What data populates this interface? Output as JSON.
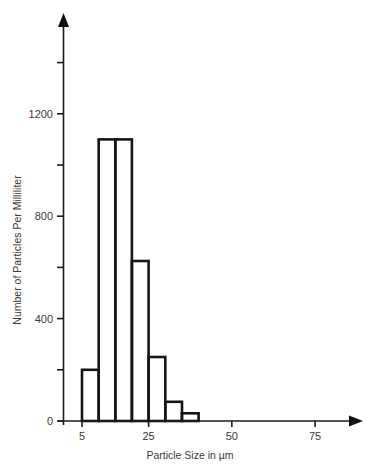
{
  "chart_data": {
    "type": "bar",
    "subtype": "histogram",
    "title": "",
    "xlabel": "Particle Size in µm",
    "ylabel": "Number of Particles Per Milliliter",
    "bin_width": 5,
    "bins": [
      {
        "start": 5,
        "end": 10,
        "value": 200
      },
      {
        "start": 10,
        "end": 15,
        "value": 1100
      },
      {
        "start": 15,
        "end": 20,
        "value": 1100
      },
      {
        "start": 20,
        "end": 25,
        "value": 625
      },
      {
        "start": 25,
        "end": 30,
        "value": 250
      },
      {
        "start": 30,
        "end": 35,
        "value": 75
      },
      {
        "start": 35,
        "end": 40,
        "value": 30
      }
    ],
    "categories": [
      "5-10",
      "10-15",
      "15-20",
      "20-25",
      "25-30",
      "30-35",
      "35-40"
    ],
    "values": [
      200,
      1100,
      1100,
      625,
      250,
      75,
      30
    ],
    "x_ticks": [
      {
        "value": 5,
        "label": "5"
      },
      {
        "value": 25,
        "label": "25"
      },
      {
        "value": 50,
        "label": "50"
      },
      {
        "value": 75,
        "label": "75"
      }
    ],
    "y_ticks": [
      {
        "value": 0,
        "label": "0"
      },
      {
        "value": 200,
        "label": ""
      },
      {
        "value": 400,
        "label": "400"
      },
      {
        "value": 600,
        "label": ""
      },
      {
        "value": 800,
        "label": "800"
      },
      {
        "value": 1000,
        "label": ""
      },
      {
        "value": 1200,
        "label": "1200"
      },
      {
        "value": 1400,
        "label": ""
      }
    ],
    "xlim": [
      0,
      90
    ],
    "ylim": [
      0,
      1590
    ],
    "grid": false,
    "legend": null,
    "axis_arrows": true,
    "colors": {
      "bars": "#151515",
      "axes": "#1c1c1c",
      "text": "#3a3a3a",
      "background": "#ffffff"
    }
  }
}
